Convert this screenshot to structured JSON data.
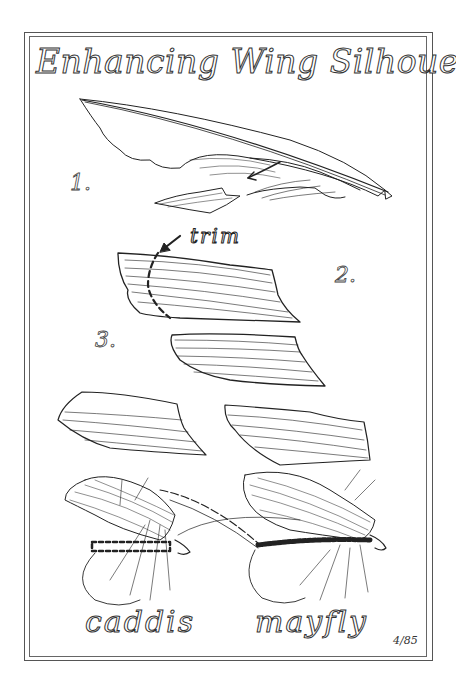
{
  "title": "Enhancing Wing Silhouette",
  "steps": [
    {
      "label": "1."
    },
    {
      "label": "2."
    },
    {
      "label": "3."
    }
  ],
  "annotation": {
    "trim_label": "trim"
  },
  "captions": {
    "left": "caddis",
    "right": "mayfly"
  },
  "signature": "4/85",
  "colors": {
    "ink": "#222222",
    "paper": "#ffffff",
    "frame": "#555555"
  }
}
